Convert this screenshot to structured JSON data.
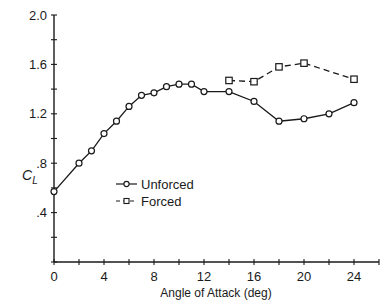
{
  "chart_data": {
    "type": "line",
    "title": "",
    "xlabel": "Angle of Attack (deg)",
    "ylabel": "C_L",
    "ylabel_main": "C",
    "ylabel_sub": "L",
    "xlim": [
      0,
      26
    ],
    "ylim": [
      0,
      2.0
    ],
    "x_ticks": [
      0,
      2,
      4,
      6,
      8,
      10,
      12,
      14,
      16,
      18,
      20,
      22,
      24,
      26
    ],
    "x_tick_labels": [
      {
        "value": 0,
        "label": "0"
      },
      {
        "value": 4,
        "label": "4"
      },
      {
        "value": 8,
        "label": "8"
      },
      {
        "value": 12,
        "label": "12"
      },
      {
        "value": 16,
        "label": "16"
      },
      {
        "value": 20,
        "label": "20"
      },
      {
        "value": 24,
        "label": "24"
      }
    ],
    "y_ticks": [
      0,
      0.2,
      0.4,
      0.6,
      0.8,
      1.0,
      1.2,
      1.4,
      1.6,
      1.8,
      2.0
    ],
    "y_tick_labels": [
      {
        "value": 0.4,
        "label": ".4"
      },
      {
        "value": 0.8,
        "label": ".8"
      },
      {
        "value": 1.2,
        "label": "1.2"
      },
      {
        "value": 1.6,
        "label": "1.6"
      },
      {
        "value": 2.0,
        "label": "2.0"
      }
    ],
    "grid": false,
    "legend_position": "lower right (inside plot, around x=7-10, y=0.6-0.45)",
    "series": [
      {
        "name": "Unforced",
        "line_style": "solid",
        "marker": "circle",
        "x": [
          0,
          2,
          3,
          4,
          5,
          6,
          7,
          8,
          9,
          10,
          11,
          12,
          14,
          16,
          18,
          20,
          22,
          24
        ],
        "y": [
          0.57,
          0.8,
          0.9,
          1.04,
          1.14,
          1.26,
          1.35,
          1.37,
          1.42,
          1.44,
          1.44,
          1.38,
          1.38,
          1.3,
          1.14,
          1.16,
          1.2,
          1.29
        ]
      },
      {
        "name": "Forced",
        "line_style": "dashed",
        "marker": "square",
        "x": [
          14,
          16,
          18,
          20,
          24
        ],
        "y": [
          1.47,
          1.46,
          1.58,
          1.61,
          1.48
        ]
      }
    ]
  },
  "legend": {
    "items": [
      {
        "label": "Unforced",
        "style": "solid",
        "marker": "circle"
      },
      {
        "label": "Forced",
        "style": "dashed",
        "marker": "square"
      }
    ]
  },
  "colors": {
    "ink": "#1a1a1a",
    "background": "#ffffff"
  }
}
